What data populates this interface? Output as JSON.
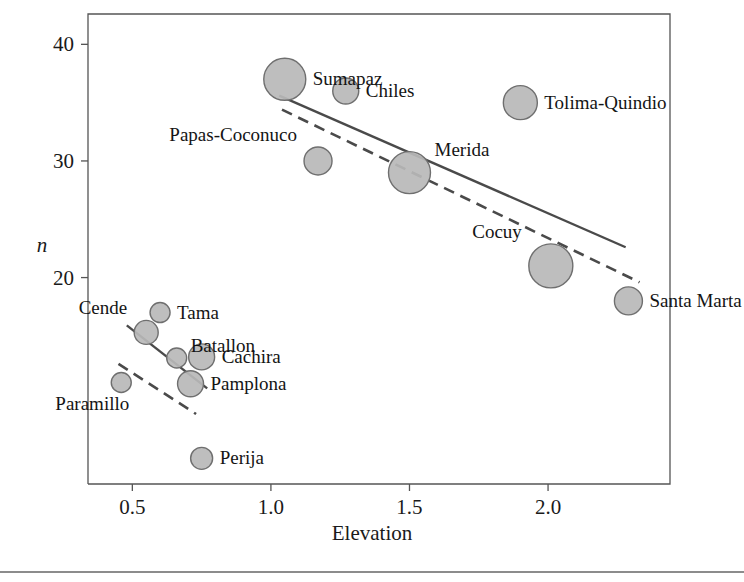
{
  "figure": {
    "background_color": "#ffffff",
    "bubble_fill": "#b9b9b9",
    "bubble_stroke": "#6f6f6f",
    "line_color": "#4a4a4a",
    "axis_color": "#555555"
  },
  "chart_data": {
    "type": "scatter",
    "title": "",
    "xlabel": "Elevation",
    "ylabel": "n",
    "ylabel_style": "italic",
    "xlim": [
      0.34,
      2.44
    ],
    "ylim": [
      2.3,
      42.6
    ],
    "xticks": [
      0.5,
      1.0,
      1.5,
      2.0
    ],
    "xtick_labels": [
      "0.5",
      "1.0",
      "1.5",
      "2.0"
    ],
    "yticks": [
      20,
      30,
      40
    ],
    "ytick_labels": [
      "20",
      "30",
      "40"
    ],
    "grid": false,
    "legend": null,
    "bubble_note": "marker area encodes a third variable (sample weight); radius given in px",
    "points": [
      {
        "label": "Sumapaz",
        "x": 1.05,
        "y": 37.0,
        "r": 21,
        "label_pos": "right"
      },
      {
        "label": "Chiles",
        "x": 1.27,
        "y": 36.0,
        "r": 13,
        "label_pos": "right"
      },
      {
        "label": "Tolima-Quindio",
        "x": 1.9,
        "y": 35.0,
        "r": 17,
        "label_pos": "right"
      },
      {
        "label": "Papas-Coconuco",
        "x": 1.17,
        "y": 30.0,
        "r": 14,
        "label_pos": "above-left"
      },
      {
        "label": "Merida",
        "x": 1.5,
        "y": 29.0,
        "r": 21,
        "label_pos": "above-right"
      },
      {
        "label": "Cocuy",
        "x": 2.01,
        "y": 21.0,
        "r": 22,
        "label_pos": "above-left"
      },
      {
        "label": "Santa Marta",
        "x": 2.29,
        "y": 18.0,
        "r": 14,
        "label_pos": "right"
      },
      {
        "label": "Tama",
        "x": 0.6,
        "y": 17.0,
        "r": 10,
        "label_pos": "right"
      },
      {
        "label": "Cende",
        "x": 0.55,
        "y": 15.3,
        "r": 12,
        "label_pos": "above-left"
      },
      {
        "label": "Batallon",
        "x": 0.66,
        "y": 13.1,
        "r": 10,
        "label_pos": "above-right"
      },
      {
        "label": "Cachira",
        "x": 0.75,
        "y": 13.2,
        "r": 13,
        "label_pos": "right"
      },
      {
        "label": "Pamplona",
        "x": 0.71,
        "y": 10.9,
        "r": 13,
        "label_pos": "right"
      },
      {
        "label": "Paramillo",
        "x": 0.46,
        "y": 11.0,
        "r": 10,
        "label_pos": "below-left"
      },
      {
        "label": "Perija",
        "x": 0.75,
        "y": 4.5,
        "r": 11,
        "label_pos": "right"
      }
    ],
    "fit_lines": [
      {
        "name": "upper-solid",
        "style": "solid",
        "x1": 1.03,
        "y1": 35.6,
        "x2": 2.28,
        "y2": 22.6
      },
      {
        "name": "upper-dashed",
        "style": "dashed",
        "x1": 1.04,
        "y1": 34.4,
        "x2": 2.33,
        "y2": 19.6
      },
      {
        "name": "lower-solid",
        "style": "solid",
        "x1": 0.48,
        "y1": 15.9,
        "x2": 0.77,
        "y2": 10.5
      },
      {
        "name": "lower-dashed",
        "style": "dashed",
        "x1": 0.45,
        "y1": 12.6,
        "x2": 0.73,
        "y2": 8.3
      }
    ]
  }
}
